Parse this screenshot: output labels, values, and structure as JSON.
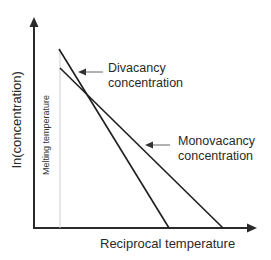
{
  "diagram": {
    "y_axis_label": "ln(concentration)",
    "x_axis_label": "Reciprocal temperature",
    "melting_label": "Melting temperature",
    "divacancy_label_line1": "Divacancy",
    "divacancy_label_line2": "concentration",
    "monovacancy_label_line1": "Monovacancy",
    "monovacancy_label_line2": "concentration",
    "colors": {
      "axis": "#2a2a2a",
      "lines": "#1e1e1e",
      "melting_line": "#c8c8c8",
      "pointer_arrow": "#555555"
    }
  }
}
